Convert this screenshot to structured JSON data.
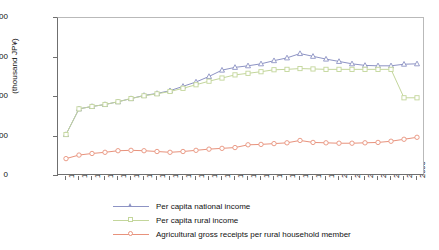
{
  "chart_data": {
    "type": "line",
    "title": "",
    "xlabel": "",
    "ylabel": "(thousand JP¥)",
    "ylim": [
      0,
      4000
    ],
    "ytick_labels": [
      "0",
      "1,000",
      "2,000",
      "3,000",
      "4,000"
    ],
    "ytick_values": [
      0,
      1000,
      2000,
      3000,
      4000
    ],
    "grid": false,
    "legend_position": "below",
    "categories": [
      "1975",
      "1980",
      "1981",
      "1982",
      "1983",
      "1984",
      "1985",
      "1986",
      "1987",
      "1988",
      "1989",
      "1990",
      "1991",
      "1992",
      "1993",
      "1994",
      "1995",
      "1996",
      "1997",
      "1998",
      "1999",
      "2000",
      "2001",
      "2002",
      "2003",
      "2004",
      "2005",
      "2006"
    ],
    "series": [
      {
        "name": "Per capita national income",
        "color": "#8d93c4",
        "marker": "triangle",
        "values": [
          1050,
          1700,
          1760,
          1810,
          1880,
          1960,
          2040,
          2090,
          2160,
          2270,
          2380,
          2520,
          2680,
          2750,
          2790,
          2840,
          2920,
          2990,
          3100,
          3030,
          2960,
          2900,
          2840,
          2800,
          2790,
          2790,
          2830,
          2840
        ]
      },
      {
        "name": "Per capita rural income",
        "color": "#c3d69b",
        "marker": "square",
        "values": [
          1050,
          1700,
          1760,
          1810,
          1880,
          1960,
          2030,
          2080,
          2140,
          2220,
          2310,
          2400,
          2480,
          2560,
          2600,
          2640,
          2690,
          2700,
          2720,
          2710,
          2700,
          2700,
          2700,
          2700,
          2700,
          2700,
          1980,
          1980
        ]
      },
      {
        "name": "Agricultural gross receipts per rural household member",
        "color": "#e8927c",
        "marker": "circle",
        "values": [
          440,
          530,
          570,
          600,
          640,
          650,
          640,
          620,
          600,
          620,
          650,
          680,
          700,
          720,
          790,
          800,
          820,
          840,
          900,
          850,
          840,
          830,
          830,
          840,
          850,
          880,
          930,
          980
        ]
      }
    ]
  }
}
